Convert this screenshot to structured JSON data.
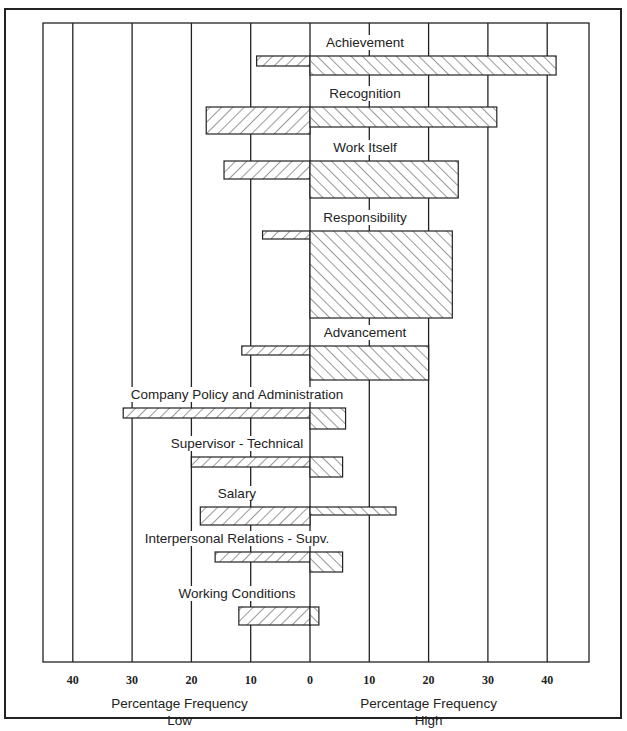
{
  "chart_data": {
    "type": "bar",
    "orientation": "horizontal-diverging",
    "title": "",
    "categories": [
      "Achievement",
      "Recognition",
      "Work Itself",
      "Responsibility",
      "Advancement",
      "Company Policy and Administration",
      "Supervisor - Technical",
      "Salary",
      "Interpersonal Relations - Supv.",
      "Working Conditions"
    ],
    "series": [
      {
        "name": "Percentage Frequency Low",
        "direction": "left",
        "values": [
          9,
          17.5,
          14.5,
          8,
          11.5,
          31.5,
          20,
          18.5,
          16,
          12
        ]
      },
      {
        "name": "Percentage Frequency High",
        "direction": "right",
        "values": [
          41.5,
          31.5,
          25,
          24,
          20,
          6,
          5.5,
          14.5,
          5.5,
          1.5
        ]
      }
    ],
    "bar_heights_px": {
      "low": [
        10,
        27,
        18,
        8,
        9,
        10,
        10,
        18,
        10,
        18
      ],
      "high": [
        19,
        20,
        37,
        87,
        34,
        21,
        20,
        8,
        20,
        18
      ]
    },
    "bar_tops_px": [
      56,
      107,
      161,
      231,
      346,
      408,
      457,
      507,
      552,
      607
    ],
    "label_y_px": [
      47,
      98,
      152,
      222,
      337,
      399,
      448,
      498,
      543,
      598
    ],
    "x_ticks": [
      "40",
      "30",
      "20",
      "10",
      "0",
      "10",
      "20",
      "30",
      "40"
    ],
    "xlabel_left": [
      "Percentage Frequency",
      "Low"
    ],
    "xlabel_right": [
      "Percentage Frequency",
      "High"
    ],
    "xlim": [
      -45,
      47
    ],
    "grid": true,
    "colors": {
      "line": "#222222",
      "hatch": "#333333",
      "background": "#ffffff"
    }
  }
}
